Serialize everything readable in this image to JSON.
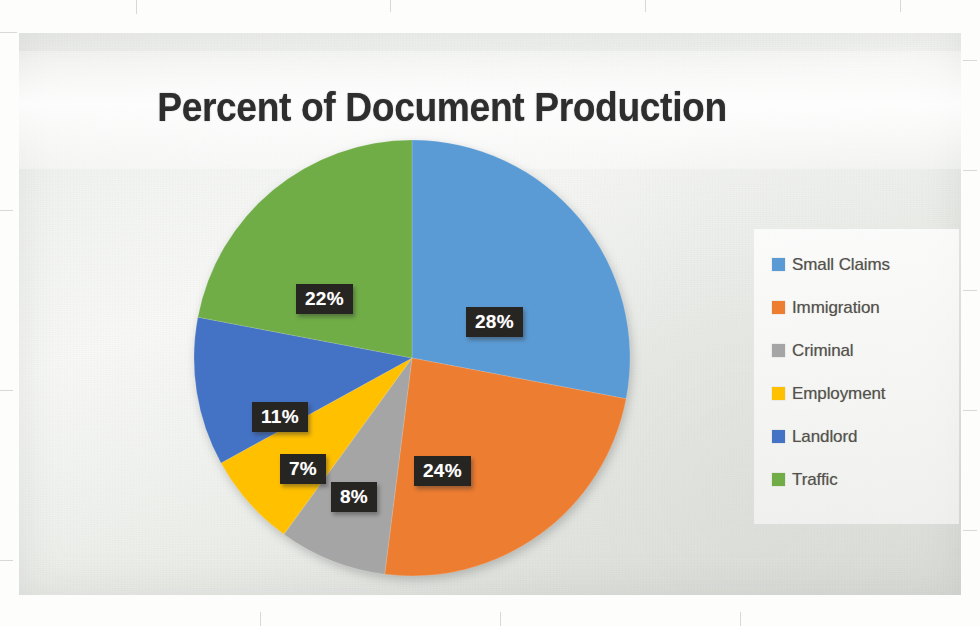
{
  "page": {
    "background_color": "#fdfdfc",
    "card_background_color": "#eef0ed"
  },
  "chart_data": {
    "type": "pie",
    "title": "Percent of Document Production",
    "xlabel": "",
    "ylabel": "",
    "legend_position": "right",
    "grid": false,
    "units": "percent",
    "start_angle_deg": 0,
    "direction": "clockwise",
    "categories": [
      "Small Claims",
      "Immigration",
      "Criminal",
      "Employment",
      "Landlord",
      "Traffic"
    ],
    "values": [
      28,
      24,
      8,
      7,
      11,
      22
    ],
    "value_labels": [
      "28%",
      "24%",
      "8%",
      "7%",
      "11%",
      "22%"
    ],
    "colors": [
      "#5B9BD5",
      "#ED7D31",
      "#A5A5A5",
      "#FFC000",
      "#4472C4",
      "#70AD47"
    ],
    "slices": [
      {
        "label": "Small Claims",
        "value": 28,
        "value_label": "28%",
        "color": "#5B9BD5"
      },
      {
        "label": "Immigration",
        "value": 24,
        "value_label": "24%",
        "color": "#ED7D31"
      },
      {
        "label": "Criminal",
        "value": 8,
        "value_label": "8%",
        "color": "#A5A5A5"
      },
      {
        "label": "Employment",
        "value": 7,
        "value_label": "7%",
        "color": "#FFC000"
      },
      {
        "label": "Landlord",
        "value": 11,
        "value_label": "11%",
        "color": "#4472C4"
      },
      {
        "label": "Traffic",
        "value": 22,
        "value_label": "22%",
        "color": "#70AD47"
      }
    ],
    "total": 100
  },
  "legend": {
    "items": [
      {
        "label": "Small Claims",
        "color": "#5B9BD5"
      },
      {
        "label": "Immigration",
        "color": "#ED7D31"
      },
      {
        "label": "Criminal",
        "color": "#A5A5A5"
      },
      {
        "label": "Employment",
        "color": "#FFC000"
      },
      {
        "label": "Landlord",
        "color": "#4472C4"
      },
      {
        "label": "Traffic",
        "color": "#70AD47"
      }
    ]
  },
  "data_labels": [
    {
      "text": "28%",
      "slice": "Small Claims"
    },
    {
      "text": "24%",
      "slice": "Immigration"
    },
    {
      "text": "8%",
      "slice": "Criminal"
    },
    {
      "text": "7%",
      "slice": "Employment"
    },
    {
      "text": "11%",
      "slice": "Landlord"
    },
    {
      "text": "22%",
      "slice": "Traffic"
    }
  ]
}
